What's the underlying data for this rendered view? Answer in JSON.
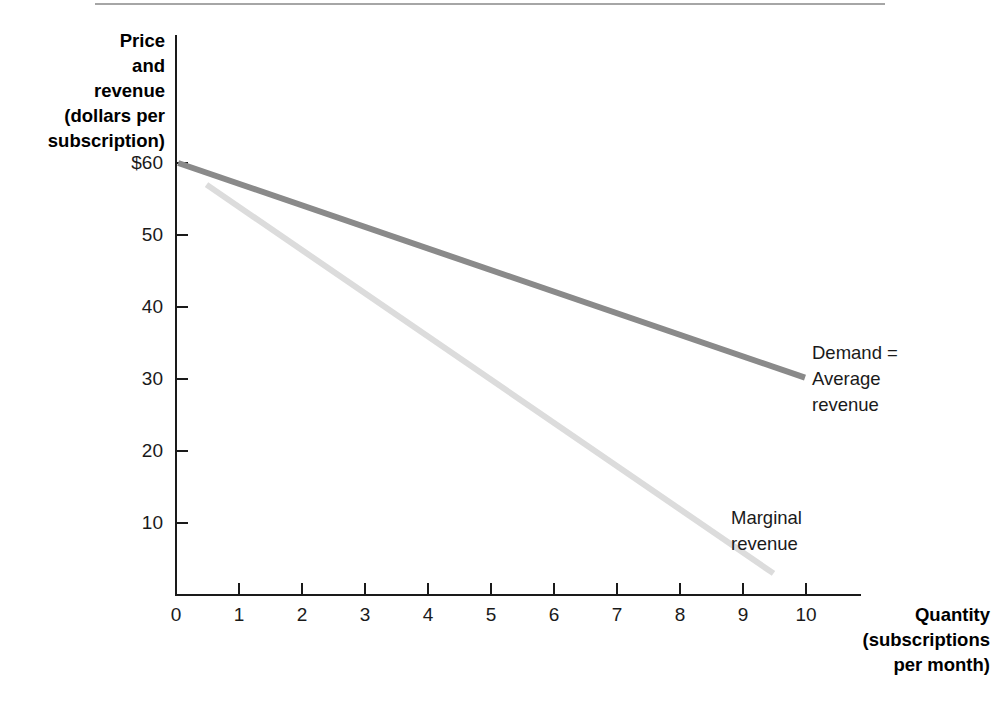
{
  "figure": {
    "kind": "economics-textbook-figure",
    "background": "#ffffff"
  },
  "axes": {
    "y_title": "Price\nand\nrevenue\n(dollars per\nsubscription)",
    "x_title": "Quantity\n(subscriptions\nper month)",
    "y_ticks": [
      "$60",
      "50",
      "40",
      "30",
      "20",
      "10"
    ],
    "x_ticks": [
      "0",
      "1",
      "2",
      "3",
      "4",
      "5",
      "6",
      "7",
      "8",
      "9",
      "10"
    ]
  },
  "annotations": {
    "demand": "Demand =\nAverage\nrevenue",
    "marginal_revenue": "Marginal\nrevenue"
  },
  "colors": {
    "demand_line": "#8a8a8a",
    "marginal_revenue_line": "#dcdcdc",
    "axis": "#1a1a1a",
    "text": "#1a1a1a",
    "top_rule": "#a6a6a6"
  },
  "chart_data": {
    "type": "line",
    "title": "",
    "xlabel": "Quantity (subscriptions per month)",
    "ylabel": "Price and revenue (dollars per subscription)",
    "xlim": [
      0,
      10.9
    ],
    "ylim": [
      0,
      61.5
    ],
    "xticks": [
      0,
      1,
      2,
      3,
      4,
      5,
      6,
      7,
      8,
      9,
      10
    ],
    "yticks": [
      10,
      20,
      30,
      40,
      50,
      60
    ],
    "grid": false,
    "legend": "inline-annotations",
    "series": [
      {
        "name": "Demand = Average revenue",
        "color": "#8a8a8a",
        "linewidth": 5,
        "x": [
          0.05,
          10.0
        ],
        "y": [
          60.0,
          30.2
        ],
        "equation": "P = 60 - 3Q",
        "points": [
          {
            "x": 0,
            "y": 60
          },
          {
            "x": 1,
            "y": 57
          },
          {
            "x": 2,
            "y": 54
          },
          {
            "x": 3,
            "y": 51
          },
          {
            "x": 4,
            "y": 48
          },
          {
            "x": 5,
            "y": 45
          },
          {
            "x": 6,
            "y": 42
          },
          {
            "x": 7,
            "y": 39
          },
          {
            "x": 8,
            "y": 36
          },
          {
            "x": 9,
            "y": 33
          },
          {
            "x": 10,
            "y": 30
          }
        ]
      },
      {
        "name": "Marginal revenue",
        "color": "#dcdcdc",
        "linewidth": 5,
        "x": [
          0.5,
          9.5
        ],
        "y": [
          57.0,
          3.0
        ],
        "equation": "MR = 60 - 6Q",
        "points": [
          {
            "x": 0.5,
            "y": 57
          },
          {
            "x": 2,
            "y": 48
          },
          {
            "x": 4,
            "y": 36
          },
          {
            "x": 6,
            "y": 24
          },
          {
            "x": 8,
            "y": 12
          },
          {
            "x": 9.5,
            "y": 3
          }
        ]
      }
    ]
  }
}
